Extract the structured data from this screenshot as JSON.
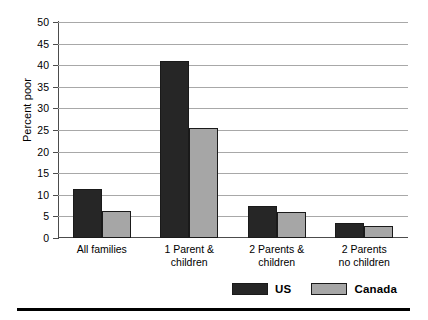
{
  "chart_data": {
    "type": "bar",
    "title": "",
    "xlabel": "",
    "ylabel": "Percent poor",
    "ylim": [
      0,
      50
    ],
    "yticks": [
      0,
      5,
      10,
      15,
      20,
      25,
      30,
      35,
      40,
      45,
      50
    ],
    "ytick_labels": [
      "0",
      "5",
      "10",
      "15",
      "20",
      "25",
      "30",
      "35",
      "40",
      "45",
      "50"
    ],
    "grid": true,
    "legend_position": "bottom-right",
    "categories": [
      "All families",
      "1 Parent & children",
      "2 Parents & children",
      "2 Parents no children"
    ],
    "category_lines": [
      [
        "All families"
      ],
      [
        "1 Parent &",
        "children"
      ],
      [
        "2 Parents &",
        "children"
      ],
      [
        "2 Parents",
        "no children"
      ]
    ],
    "series": [
      {
        "name": "US",
        "color": "#262626",
        "values": [
          11.3,
          41.0,
          7.3,
          3.5
        ]
      },
      {
        "name": "Canada",
        "color": "#a6a6a6",
        "values": [
          6.3,
          25.5,
          6.1,
          2.8
        ]
      }
    ]
  },
  "legend": {
    "items": [
      {
        "label": "US",
        "swatch": "us"
      },
      {
        "label": "Canada",
        "swatch": "canada"
      }
    ]
  },
  "colors": {
    "us": "#262626",
    "canada": "#a6a6a6",
    "grid": "#a8a8a8",
    "axis": "#4c4c4c",
    "rule": "#000000"
  }
}
